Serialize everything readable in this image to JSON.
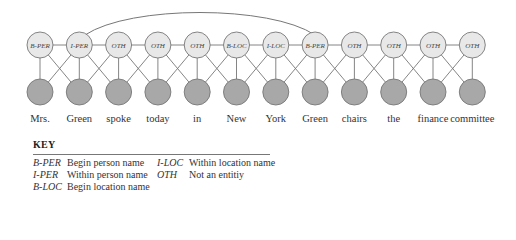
{
  "diagram": {
    "type": "linear-chain CRF / named-entity tagging graph",
    "tags": [
      "B-PER",
      "I-PER",
      "OTH",
      "OTH",
      "OTH",
      "B-LOC",
      "I-LOC",
      "B-PER",
      "OTH",
      "OTH",
      "OTH",
      "OTH"
    ],
    "words": [
      "Mrs.",
      "Green",
      "spoke",
      "today",
      "in",
      "New",
      "York",
      "Green",
      "chairs",
      "the",
      "finance",
      "committee"
    ],
    "long_range_edge": {
      "from_index": 1,
      "to_index": 7
    },
    "colors": {
      "tag_fill": "#e8e8e8",
      "word_node_fill": "#a8a8a8",
      "stroke": "#777777"
    }
  },
  "key": {
    "title": "KEY",
    "items": [
      {
        "abbr": "B-PER",
        "desc": "Begin person name"
      },
      {
        "abbr": "I-PER",
        "desc": "Within person name"
      },
      {
        "abbr": "B-LOC",
        "desc": "Begin location name"
      },
      {
        "abbr": "I-LOC",
        "desc": "Within location name"
      },
      {
        "abbr": "OTH",
        "desc": "Not an entitiy"
      }
    ]
  }
}
